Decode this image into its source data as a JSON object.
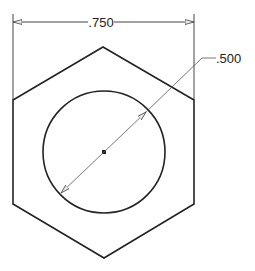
{
  "drawing": {
    "type": "hexagon-with-bore",
    "width_dimension": ".750",
    "diameter_dimension": ".500",
    "colors": {
      "outline": "#222222",
      "dimension": "#444444",
      "background": "#ffffff"
    }
  }
}
